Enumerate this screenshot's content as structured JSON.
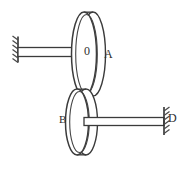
{
  "figure": {
    "type": "mechanical-engineering-line-diagram",
    "background_color": "#ffffff",
    "line_color": "#3b3b3b",
    "width": 185,
    "height": 170
  },
  "labels": {
    "disc_a": "A",
    "disc_b": "B",
    "support_right": "D",
    "hub_center": "0"
  },
  "components": {
    "disc_a": {
      "name": "A",
      "shape": "cylinder-disc",
      "center_x": 89,
      "center_y": 54,
      "radius_x": 13,
      "radius_y": 42,
      "thickness": 10
    },
    "disc_b": {
      "name": "B",
      "shape": "cylinder-disc",
      "center_x": 82,
      "center_y": 122,
      "radius_x": 12,
      "radius_y": 33,
      "thickness": 9
    },
    "shaft_left": {
      "from_x": 18,
      "to_x": 80,
      "center_y": 52,
      "height": 9
    },
    "shaft_right": {
      "from_x": 88,
      "to_x": 165,
      "center_y": 121,
      "height": 8
    },
    "support_left": {
      "x": 18,
      "y_top": 37,
      "y_bottom": 62,
      "hatch_side": "left"
    },
    "support_right": {
      "x": 164,
      "y_top": 107,
      "y_bottom": 135,
      "hatch_side": "right"
    }
  }
}
